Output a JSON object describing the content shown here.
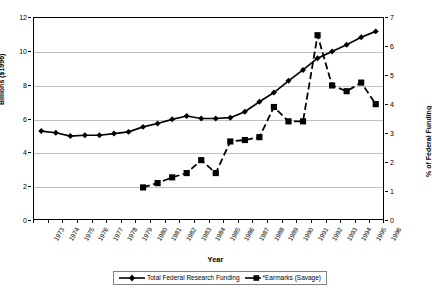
{
  "axes": {
    "x_title": "Year",
    "y_left_title": "Billions ($1996)",
    "y_right_title": "% of Federal Funding",
    "y_left_ticks": [
      "0",
      "2",
      "4",
      "6",
      "8",
      "10",
      "12"
    ],
    "y_right_ticks": [
      "0",
      "1",
      "2",
      "3",
      "4",
      "5",
      "6",
      "7"
    ],
    "x_ticks": [
      "1973",
      "1974",
      "1975",
      "1976",
      "1977",
      "1978",
      "1979",
      "1980",
      "1981",
      "1982",
      "1983",
      "1984",
      "1985",
      "1986",
      "1987",
      "1988",
      "1989",
      "1990",
      "1991",
      "1992",
      "1993",
      "1994",
      "1995",
      "1996"
    ]
  },
  "legend": {
    "items": [
      {
        "label": "Total Federal Research Funding",
        "marker": "diamond-marker",
        "line": "solid"
      },
      {
        "label": "*Earmarks (Savage)",
        "marker": "square-marker",
        "line": "dashed"
      }
    ]
  },
  "colors": {
    "series": "#000000",
    "gridline": "#c0c0c0",
    "axis": "#000000",
    "background": "#ffffff"
  },
  "chart_data": {
    "type": "line",
    "title": "",
    "xlabel": "Year",
    "ylabel": "Billions ($1996)",
    "y2label": "% of Federal Funding",
    "ylim": [
      0,
      12
    ],
    "y2lim": [
      0,
      7
    ],
    "grid": true,
    "legend_position": "bottom",
    "x": [
      "1973",
      "1974",
      "1975",
      "1976",
      "1977",
      "1978",
      "1979",
      "1980",
      "1981",
      "1982",
      "1983",
      "1984",
      "1985",
      "1986",
      "1987",
      "1988",
      "1989",
      "1990",
      "1991",
      "1992",
      "1993",
      "1994",
      "1995",
      "1996"
    ],
    "series": [
      {
        "name": "Total Federal Research Funding",
        "axis": "left",
        "marker": "diamond",
        "linestyle": "solid",
        "unit": "Billions ($1996)",
        "values": [
          5.25,
          5.15,
          4.95,
          5.0,
          5.0,
          5.1,
          5.2,
          5.5,
          5.7,
          5.95,
          6.15,
          6.0,
          6.0,
          6.05,
          6.4,
          7.0,
          7.55,
          8.25,
          8.9,
          9.6,
          10.0,
          10.4,
          10.85,
          11.2
        ]
      },
      {
        "name": "*Earmarks (Savage)",
        "axis": "right",
        "marker": "square",
        "linestyle": "dashed",
        "unit": "% of Federal Funding",
        "values": [
          null,
          null,
          null,
          null,
          null,
          null,
          null,
          1.1,
          1.25,
          1.45,
          1.6,
          2.05,
          1.6,
          2.7,
          2.75,
          2.85,
          3.9,
          3.4,
          3.4,
          6.4,
          4.65,
          4.45,
          4.75,
          4.0
        ]
      }
    ]
  }
}
